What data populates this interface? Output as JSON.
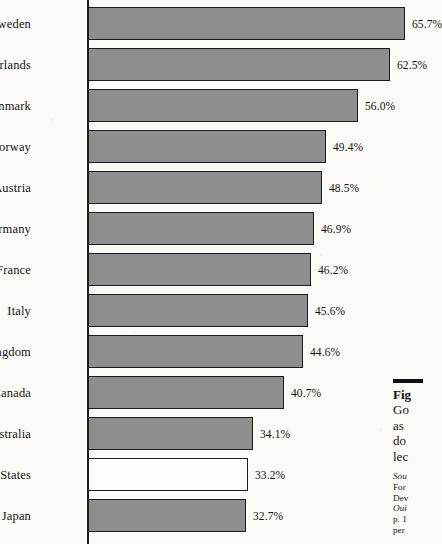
{
  "figure": {
    "axis_color": "#1c1c1c",
    "bar_fill_color": "#8e8e8e",
    "bar_hollow_color": "#fdfdfb",
    "bar_border_color": "#1b1b1b",
    "page_background": "#fbfaf7"
  },
  "chart_data": {
    "type": "bar",
    "orientation": "horizontal",
    "title": "",
    "xlabel": "",
    "ylabel": "",
    "grid": false,
    "legend": "none",
    "xlim": [
      0,
      70
    ],
    "value_suffix": "%",
    "categories": [
      "Sweden",
      "Netherlands",
      "Denmark",
      "Norway",
      "Austria",
      "West Germany",
      "France",
      "Italy",
      "United Kingdom",
      "Canada",
      "Australia",
      "United States",
      "Japan"
    ],
    "values": [
      65.7,
      62.5,
      56.0,
      49.4,
      48.5,
      46.9,
      46.2,
      45.6,
      44.6,
      40.7,
      34.1,
      33.2,
      32.7
    ],
    "value_labels": [
      "65.7%",
      "62.5%",
      "56.0%",
      "49.4%",
      "48.5%",
      "46.9%",
      "46.2%",
      "45.6%",
      "44.6%",
      "40.7%",
      "34.1%",
      "33.2%",
      "32.7%"
    ],
    "highlighted_category": "United States",
    "highlight_style": "hollow"
  },
  "caption": {
    "rule": "",
    "lead": "Fig",
    "lines": [
      "Go",
      "as",
      "do",
      "lec"
    ]
  },
  "source_note": {
    "lines": [
      "Sou",
      "For",
      "Dev",
      "Oui",
      "p. 1",
      "per"
    ],
    "italic_lines": [
      "Sou",
      "Oui"
    ]
  }
}
